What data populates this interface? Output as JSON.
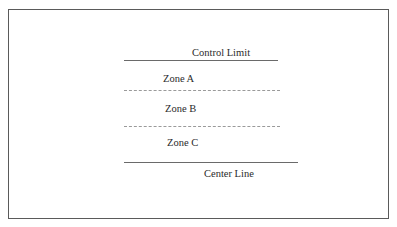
{
  "diagram": {
    "labels": {
      "control_limit": "Control Limit",
      "zone_a": "Zone A",
      "zone_b": "Zone B",
      "zone_c": "Zone C",
      "center_line": "Center Line"
    },
    "lines": [
      {
        "name": "control-limit-line",
        "style": "solid"
      },
      {
        "name": "zone-a-b-boundary",
        "style": "dashed"
      },
      {
        "name": "zone-b-c-boundary",
        "style": "dashed"
      },
      {
        "name": "center-line",
        "style": "solid"
      }
    ]
  }
}
